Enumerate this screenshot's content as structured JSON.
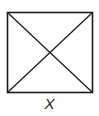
{
  "diagram": {
    "shape": "square-with-diagonals",
    "label": "X",
    "stroke_color": "#1a1a1a",
    "background": "#ffffff"
  }
}
